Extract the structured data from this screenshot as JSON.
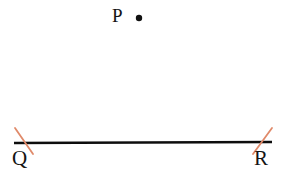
{
  "diagram": {
    "background_color": "#ffffff",
    "labels": {
      "point_p": "P",
      "endpoint_q": "Q",
      "endpoint_r": "R"
    },
    "colors": {
      "line": "#0d0d0d",
      "tick_mark": "#e08a6a",
      "point_dot": "#111111",
      "label_text": "#141414"
    },
    "geometry": {
      "segment": {
        "name": "QR",
        "x1": 14,
        "y1": 143,
        "x2": 272,
        "y2": 142,
        "stroke_width": 2.6
      },
      "point_p": {
        "cx": 139,
        "cy": 18,
        "r": 3.2
      },
      "tick_left": {
        "x1": 15,
        "y1": 128,
        "x2": 33,
        "y2": 154,
        "stroke_width": 1.8
      },
      "tick_right": {
        "x1": 272,
        "y1": 128,
        "x2": 253,
        "y2": 154,
        "stroke_width": 1.8
      }
    }
  }
}
